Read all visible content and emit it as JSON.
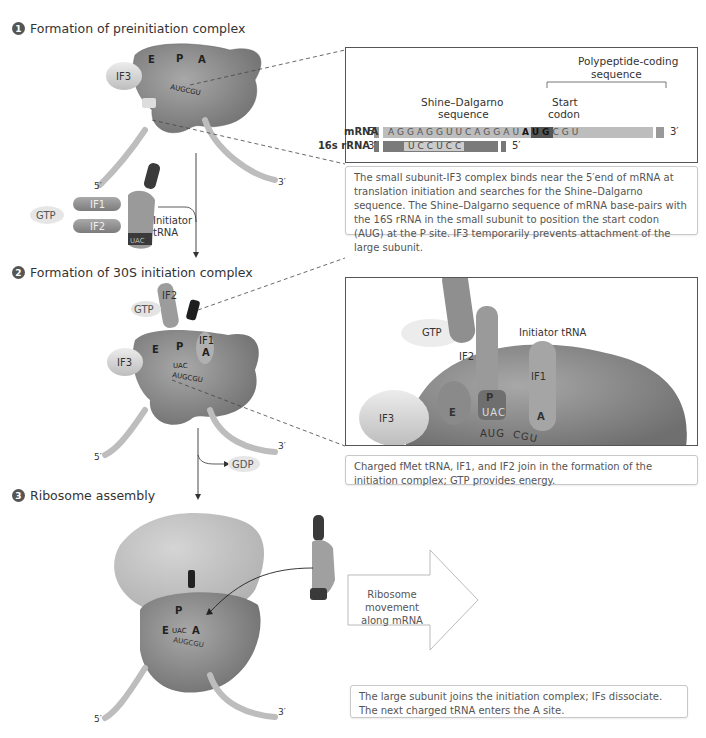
{
  "steps": [
    {
      "number": "1",
      "title": "Formation of preinitiation complex"
    },
    {
      "number": "2",
      "title": "Formation of 30S initiation complex"
    },
    {
      "number": "3",
      "title": "Ribosome assembly"
    }
  ],
  "step1": {
    "ribosome_sites": [
      "E",
      "P",
      "A"
    ],
    "factor": "IF3",
    "codon_label": "AUGCGU",
    "mrna_5": "5′",
    "mrna_3": "3′",
    "free_factors": [
      "IF1",
      "IF2"
    ],
    "gtp": "GTP",
    "trna_label_line1": "Initiator",
    "trna_label_line2": "tRNA",
    "trna_anticodon": "UAC",
    "trna_aa": "fMet",
    "inset": {
      "polypeptide_label_line1": "Polypeptide-coding",
      "polypeptide_label_line2": "sequence",
      "shine_label_line1": "Shine–Dalgarno",
      "shine_label_line2": "sequence",
      "start_label_line1": "Start",
      "start_label_line2": "codon",
      "mrna_label": "mRNA",
      "mrna_5": "5′",
      "mrna_3": "3′",
      "mrna_seq_pre": "AGGAGGUUCAGGAU",
      "mrna_seq_start": "AUG",
      "mrna_seq_post": "CGU",
      "rrna_label": "16s rRNA",
      "rrna_3": "3′",
      "rrna_5": "5′",
      "rrna_seq": "UCCUCC"
    },
    "caption": "The small subunit-IF3 complex binds near the 5′end of mRNA at translation initiation and searches for the Shine–Dalgarno sequence. The Shine–Dalgarno sequence of mRNA base-pairs with the 16S rRNA in the small subunit to position the start codon (AUG) at the P site. IF3 temporarily prevents attachment of the large subunit."
  },
  "step2": {
    "labels": {
      "if2": "IF2",
      "gtp": "GTP",
      "if1": "IF1",
      "if3": "IF3",
      "e": "E",
      "p": "P",
      "a": "A",
      "anticodon": "UAC",
      "codon": "AUGCGU",
      "mrna_5": "5′",
      "mrna_3": "3′",
      "gdp": "GDP"
    },
    "inset": {
      "gtp": "GTP",
      "if2": "IF2",
      "initiator": "Initiator tRNA",
      "if1": "IF1",
      "if3": "IF3",
      "e": "E",
      "p": "P",
      "a": "A",
      "anticodon": "UAC",
      "codon1": "AUG",
      "codon2": "CGU"
    },
    "caption": "Charged fMet tRNA, IF1, and IF2 join in the formation of the initiation complex; GTP provides energy."
  },
  "step3": {
    "labels": {
      "p": "P",
      "e": "E",
      "a": "A",
      "anticodon": "UAC",
      "codon": "AUGCGU",
      "fmet": "fMet",
      "mrna_5": "5′",
      "mrna_3": "3′",
      "next_aa": "Arg",
      "next_anticodon": "GCA"
    },
    "movement_line1": "Ribosome movement",
    "movement_line2": "along mRNA",
    "caption": "The large subunit joins the initiation complex; IFs dissociate. The next charged tRNA enters the A site."
  },
  "colors": {
    "ribosome": "#8a8a8a",
    "ribosome_light": "#b5b5b5",
    "factor": "#d6d6d6",
    "mrna": "#c4c4c4",
    "dark": "#3a3a3a",
    "panel_border": "#555555"
  }
}
